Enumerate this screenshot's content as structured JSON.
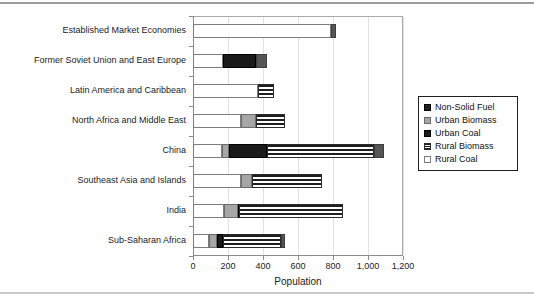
{
  "chart_data": {
    "type": "bar",
    "orientation": "horizontal",
    "stacked": true,
    "title": "",
    "xlabel": "Population",
    "ylabel": "",
    "xlim": [
      0,
      1200
    ],
    "xticks": [
      0,
      200,
      400,
      600,
      800,
      1000,
      1200
    ],
    "xticklabels": [
      "0",
      "200",
      "400",
      "600",
      "800",
      "1,000",
      "1,200"
    ],
    "grid": true,
    "legend_position": "right",
    "categories": [
      "Established Market Economies",
      "Former Soviet Union and East Europe",
      "Latin America and Caribbean",
      "North Africa and Middle East",
      "China",
      "Southeast Asia and Islands",
      "India",
      "Sub-Saharan Africa"
    ],
    "series": [
      {
        "name": "Non-Solid Fuel",
        "values": [
          790,
          170,
          370,
          275,
          165,
          275,
          175,
          90
        ]
      },
      {
        "name": "Urban Biomass",
        "values": [
          0,
          0,
          0,
          85,
          40,
          60,
          80,
          45
        ]
      },
      {
        "name": "Urban Coal",
        "values": [
          0,
          190,
          0,
          0,
          220,
          0,
          10,
          35
        ]
      },
      {
        "name": "Rural Biomass",
        "values": [
          0,
          0,
          90,
          165,
          610,
          400,
          590,
          330
        ]
      },
      {
        "name": "Rural Coal",
        "values": [
          25,
          65,
          0,
          0,
          55,
          0,
          0,
          25
        ]
      }
    ],
    "totals": [
      815,
      425,
      460,
      525,
      1090,
      735,
      855,
      525
    ]
  },
  "legend": {
    "items": [
      {
        "label": "Non-Solid Fuel",
        "pattern": "solid-dark-small",
        "color": "#1f1f1f"
      },
      {
        "label": "Urban Biomass",
        "pattern": "solid-gray",
        "color": "#a6a6a6"
      },
      {
        "label": "Urban Coal",
        "pattern": "solid-black",
        "color": "#1a1a1a"
      },
      {
        "label": "Rural Biomass",
        "pattern": "horizontal-stripes",
        "color": "#1f1f1f"
      },
      {
        "label": "Rural Coal",
        "pattern": "solid-white",
        "color": "#ffffff"
      }
    ]
  },
  "colors": {
    "axis": "#8c8c8c",
    "frame": "#aaaaaa",
    "grid": "#e2e2e2",
    "text": "#1c1c1c"
  }
}
